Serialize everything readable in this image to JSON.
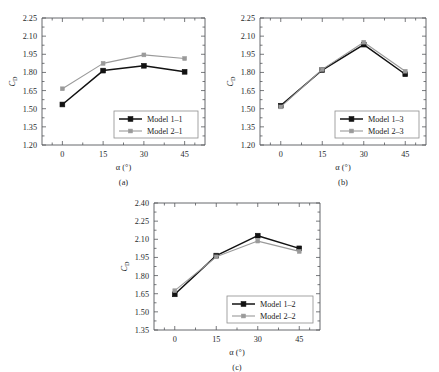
{
  "figure": {
    "panels": [
      {
        "caption": "(a)",
        "xlabel_symbol": "α",
        "xlabel_unit": "(°)",
        "ylabel_main": "C",
        "ylabel_sub": "D"
      },
      {
        "caption": "(b)",
        "xlabel_symbol": "α",
        "xlabel_unit": "(°)",
        "ylabel_main": "C",
        "ylabel_sub": "D"
      },
      {
        "caption": "(c)",
        "xlabel_symbol": "α",
        "xlabel_unit": "(°)",
        "ylabel_main": "C",
        "ylabel_sub": "D"
      }
    ]
  },
  "colors": {
    "series_dark": "#121212",
    "series_light": "#9a9a9a",
    "axis": "#55585c",
    "background": "#ffffff"
  },
  "chart_data": [
    {
      "type": "line",
      "title": "(a)",
      "xlabel": "α (°)",
      "ylabel": "CD",
      "x": [
        0,
        15,
        30,
        45
      ],
      "xticklabels": [
        "0",
        "15",
        "30",
        "45"
      ],
      "xlim": [
        -7.5,
        52.5
      ],
      "ylim": [
        1.2,
        2.25
      ],
      "yticks": [
        1.2,
        1.35,
        1.5,
        1.65,
        1.8,
        1.95,
        2.1,
        2.25
      ],
      "yticklabels": [
        "1.20",
        "1.35",
        "1.50",
        "1.65",
        "1.80",
        "1.95",
        "2.10",
        "2.25"
      ],
      "grid": false,
      "legend_position": "lower right",
      "series": [
        {
          "name": "Model 1–1",
          "values": [
            1.535,
            1.815,
            1.855,
            1.805
          ],
          "color": "#121212",
          "marker": "square"
        },
        {
          "name": "Model 2–1",
          "values": [
            1.665,
            1.875,
            1.945,
            1.915
          ],
          "color": "#9a9a9a",
          "marker": "square"
        }
      ]
    },
    {
      "type": "line",
      "title": "(b)",
      "xlabel": "α (°)",
      "ylabel": "CD",
      "x": [
        0,
        15,
        30,
        45
      ],
      "xticklabels": [
        "0",
        "15",
        "30",
        "45"
      ],
      "xlim": [
        -7.5,
        52.5
      ],
      "ylim": [
        1.2,
        2.25
      ],
      "yticks": [
        1.2,
        1.35,
        1.5,
        1.65,
        1.8,
        1.95,
        2.1,
        2.25
      ],
      "yticklabels": [
        "1.20",
        "1.35",
        "1.50",
        "1.65",
        "1.80",
        "1.95",
        "2.10",
        "2.25"
      ],
      "grid": false,
      "legend_position": "lower right",
      "series": [
        {
          "name": "Model 1–3",
          "values": [
            1.525,
            1.82,
            2.03,
            1.785
          ],
          "color": "#121212",
          "marker": "square"
        },
        {
          "name": "Model 2–3",
          "values": [
            1.515,
            1.825,
            2.05,
            1.81
          ],
          "color": "#9a9a9a",
          "marker": "square"
        }
      ]
    },
    {
      "type": "line",
      "title": "(c)",
      "xlabel": "α (°)",
      "ylabel": "CD",
      "x": [
        0,
        15,
        30,
        45
      ],
      "xticklabels": [
        "0",
        "15",
        "30",
        "45"
      ],
      "xlim": [
        -7.5,
        52.5
      ],
      "ylim": [
        1.35,
        2.4
      ],
      "yticks": [
        1.35,
        1.5,
        1.65,
        1.8,
        1.95,
        2.1,
        2.25,
        2.4
      ],
      "yticklabels": [
        "1.35",
        "1.50",
        "1.65",
        "1.80",
        "1.95",
        "2.10",
        "2.25",
        "2.40"
      ],
      "grid": false,
      "legend_position": "lower right",
      "series": [
        {
          "name": "Model 1–2",
          "values": [
            1.645,
            1.965,
            2.13,
            2.025
          ],
          "color": "#121212",
          "marker": "square"
        },
        {
          "name": "Model 2–2",
          "values": [
            1.675,
            1.955,
            2.085,
            2.0
          ],
          "color": "#9a9a9a",
          "marker": "square"
        }
      ]
    }
  ]
}
